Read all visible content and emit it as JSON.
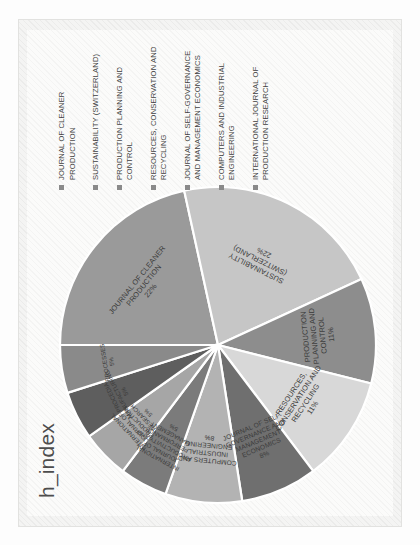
{
  "figure": {
    "title": "h_index"
  },
  "legend": {
    "items": [
      {
        "label": "JOURNAL OF CLEANER PRODUCTION",
        "marker": "square-marker"
      },
      {
        "label": "SUSTAINABILITY (SWITZERLAND)",
        "marker": "square-marker"
      },
      {
        "label": "PRODUCTION PLANNING AND CONTROL",
        "marker": "square-marker"
      },
      {
        "label": "RESOURCES, CONSERVATION AND RECYCLING",
        "marker": "square-marker"
      },
      {
        "label": "JOURNAL OF SELF-GOVERNANCE AND MANAGEMENT ECONOMICS",
        "marker": "square-marker"
      },
      {
        "label": "COMPUTERS AND INDUSTRIAL ENGINEERING",
        "marker": "square-marker"
      },
      {
        "label": "INTERNATIONAL JOURNAL OF PRODUCTION RESEARCH",
        "marker": "square-marker"
      }
    ]
  },
  "chart_data": {
    "type": "pie",
    "title": "h_index",
    "xlabel": "",
    "ylabel": "",
    "legend_position": "right",
    "grid": false,
    "categories": [
      "JOURNAL OF CLEANER PRODUCTION",
      "SUSTAINABILITY (SWITZERLAND)",
      "PRODUCTION PLANNING AND CONTROL",
      "RESOURCES, CONSERVATION AND RECYCLING",
      "JOURNAL OF SELF-GOVERNANCE AND MANAGEMENT ECONOMICS",
      "COMPUTERS AND INDUSTRIAL ENGINEERING",
      "INTERNATIONAL JOURNAL OF PRODUCTIVITY AND PERFORMANCE MANAGEMENT",
      "INTERNATIONAL JOURNAL OF PRODUCTION RESEARCH",
      "PROCEDIA MANUFACTURING",
      "PROCESSES"
    ],
    "values": [
      22,
      22,
      11,
      11,
      8,
      8,
      5,
      5,
      5,
      5
    ],
    "value_labels": [
      "22%",
      "22%",
      "11%",
      "11%",
      "8%",
      "8%",
      "5%",
      "5%",
      "5%",
      "5%"
    ],
    "colors": [
      "#9a9a9a",
      "#c6c6c6",
      "#8d8d8d",
      "#d8d8d8",
      "#6f6f6f",
      "#b3b3b3",
      "#7b7b7b",
      "#a6a6a6",
      "#5e5e5e",
      "#8a8a8a"
    ],
    "slices": [
      {
        "label": "JOURNAL OF CLEANER PRODUCTION",
        "pct": "22%",
        "lines": [
          "JOURNAL OF CLEANER",
          "PRODUCTION",
          "22%"
        ]
      },
      {
        "label": "SUSTAINABILITY (SWITZERLAND)",
        "pct": "22%",
        "lines": [
          "SUSTAINABILITY",
          "(SWITZERLAND)",
          "22%"
        ]
      },
      {
        "label": "PRODUCTION PLANNING AND CONTROL",
        "pct": "11%",
        "lines": [
          "PRODUCTION",
          "PLANNING AND",
          "CONTROL",
          "11%"
        ]
      },
      {
        "label": "RESOURCES, CONSERVATION AND RECYCLING",
        "pct": "11%",
        "lines": [
          "RESOURCES,",
          "CONSERVATION AND",
          "RECYCLING",
          "11%"
        ]
      },
      {
        "label": "JOURNAL OF SELF-GOVERNANCE AND MANAGEMENT ECONOMICS",
        "pct": "8%",
        "lines": [
          "JOURNAL OF SELF-",
          "GOVERNANCE AND",
          "MANAGEMENT",
          "ECONOMICS",
          "8%"
        ]
      },
      {
        "label": "COMPUTERS AND INDUSTRIAL ENGINEERING",
        "pct": "8%",
        "lines": [
          "COMPUTERS AND",
          "INDUSTRIAL",
          "ENGINEERING",
          "8%"
        ]
      },
      {
        "label": "INTERNATIONAL JOURNAL OF PRODUCTIVITY AND PERFORMANCE MANAGEMENT",
        "pct": "5%",
        "lines": [
          "INTERNATIONAL",
          "JOURNAL OF",
          "PRODUCTIVITY AND",
          "PERFORMANCE",
          "MANAGEMENT",
          "5%"
        ]
      },
      {
        "label": "INTERNATIONAL JOURNAL OF PRODUCTION RESEARCH",
        "pct": "5%",
        "lines": [
          "INTERNATIONAL",
          "JOURNAL OF",
          "PRODUCTION",
          "RESEARCH",
          "5%"
        ]
      },
      {
        "label": "PROCEDIA MANUFACTURING",
        "pct": "5%",
        "lines": [
          "PROCEDIA",
          "MANUFACTURING",
          "5%"
        ]
      },
      {
        "label": "PROCESSES",
        "pct": "5%",
        "lines": [
          "PROCESSES",
          "5%"
        ]
      }
    ]
  }
}
